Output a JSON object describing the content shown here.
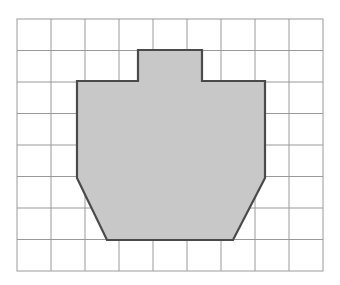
{
  "figure": {
    "kind": "grid-shape-area-diagram",
    "canvas": {
      "width": 340,
      "height": 285,
      "background_color": "#ffffff"
    },
    "grid": {
      "origin_x": 17,
      "origin_y": 19,
      "columns": 9,
      "rows": 8,
      "cell_width": 34,
      "cell_height": 31.5,
      "line_color": "#9a9a9a",
      "line_width": 1,
      "border_color": "#9a9a9a",
      "border_width": 1,
      "show_labels": false,
      "column_x": [
        17,
        51,
        85,
        119,
        153,
        187,
        221,
        255,
        289,
        323
      ],
      "row_y": [
        19,
        50.5,
        82,
        113.5,
        145,
        176.5,
        208,
        239.5,
        271
      ]
    },
    "shape": {
      "name": "shaded-polygon",
      "fill_color": "#c8c8c8",
      "stroke_color": "#4a4a4a",
      "stroke_width": 2.2,
      "grid_vertices": [
        [
          3.55,
          1
        ],
        [
          5.45,
          1
        ],
        [
          5.45,
          2
        ],
        [
          7.3,
          2
        ],
        [
          7.3,
          5
        ],
        [
          6.35,
          7
        ],
        [
          2.65,
          7
        ],
        [
          1.76,
          5
        ],
        [
          1.76,
          2
        ],
        [
          3.55,
          2
        ]
      ],
      "pixel_vertices": [
        [
          138,
          50
        ],
        [
          202,
          50
        ],
        [
          202,
          81
        ],
        [
          265,
          81
        ],
        [
          265,
          178
        ],
        [
          233,
          240
        ],
        [
          107,
          240
        ],
        [
          77,
          178
        ],
        [
          77,
          81
        ],
        [
          138,
          81
        ]
      ],
      "cells_covered": 31,
      "feature_notes": [
        "rectangular tab on top spanning 2 cells wide and 1 cell tall",
        "rectangular body spanning about 5.5 cells wide and 3 cells tall",
        "trapezoidal lower portion with slanted left and right sides",
        "flat bottom edge about 3.7 cells wide"
      ]
    }
  }
}
